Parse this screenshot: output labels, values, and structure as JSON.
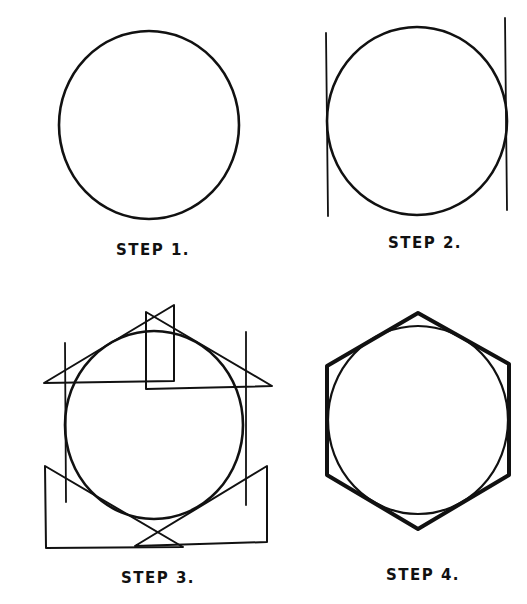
{
  "colors": {
    "ink": "#111111",
    "background": "#ffffff"
  },
  "steps": [
    {
      "label": "STEP 1.",
      "description": "Draw a circle"
    },
    {
      "label": "STEP 2.",
      "description": "Draw two vertical lines tangent to the circle"
    },
    {
      "label": "STEP 3.",
      "description": "Use a 30-60 triangle to draw four lines tangent to the circle"
    },
    {
      "label": "STEP 4.",
      "description": "Completed hexagon circumscribing the circle"
    }
  ]
}
